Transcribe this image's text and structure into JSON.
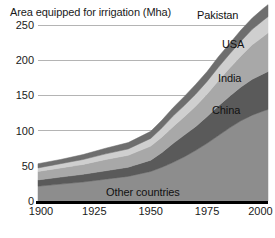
{
  "chart_data": {
    "type": "area",
    "title": "Area equipped for irrigation (Mha)",
    "xlabel": "",
    "ylabel": "Area equipped for irrigation (Mha)",
    "stacked": true,
    "grid": true,
    "legend_position": "inline-right",
    "xlim": [
      1900,
      2002
    ],
    "ylim": [
      0,
      280
    ],
    "xticks": [
      1900,
      1925,
      1950,
      1975,
      2000
    ],
    "yticks": [
      0,
      50,
      100,
      150,
      200,
      250
    ],
    "xtick_labels": [
      "1900",
      "1925",
      "1950",
      "1975",
      "2000"
    ],
    "ytick_labels": [
      "0",
      "50",
      "100",
      "150",
      "200",
      "250"
    ],
    "x": [
      1900,
      1910,
      1920,
      1930,
      1940,
      1950,
      1955,
      1960,
      1965,
      1970,
      1975,
      1980,
      1985,
      1990,
      1995,
      2000,
      2002
    ],
    "series": [
      {
        "name": "Other countries",
        "label": "Other countries",
        "color": "#8d8d8d",
        "values": [
          21,
          24,
          27,
          31,
          35,
          42,
          48,
          55,
          63,
          72,
          82,
          93,
          104,
          114,
          122,
          128,
          130
        ]
      },
      {
        "name": "China",
        "label": "China",
        "color": "#5a5a5a",
        "values": [
          9,
          10,
          11,
          12,
          13,
          16,
          21,
          27,
          31,
          34,
          38,
          42,
          45,
          48,
          51,
          53,
          54
        ]
      },
      {
        "name": "India",
        "label": "India",
        "color": "#a8a8a8",
        "values": [
          12,
          13,
          14,
          16,
          17,
          20,
          22,
          24,
          26,
          29,
          32,
          36,
          40,
          44,
          49,
          53,
          55
        ]
      },
      {
        "name": "USA",
        "label": "USA",
        "color": "#cfcfcf",
        "values": [
          5,
          6,
          7,
          8,
          9,
          11,
          13,
          15,
          16,
          17,
          18,
          19,
          20,
          21,
          22,
          23,
          23
        ]
      },
      {
        "name": "Pakistan",
        "label": "Pakistan",
        "color": "#6e6e6e",
        "values": [
          6,
          6,
          7,
          8,
          9,
          10,
          11,
          12,
          13,
          14,
          14,
          15,
          15,
          16,
          16,
          17,
          17
        ]
      }
    ],
    "totals": [
      53,
      59,
      66,
      75,
      83,
      99,
      115,
      133,
      149,
      166,
      184,
      205,
      224,
      243,
      260,
      274,
      279
    ],
    "series_labels_placement": [
      {
        "name": "Pakistan",
        "x_px": 197,
        "y_px": 9
      },
      {
        "name": "USA",
        "x_px": 222,
        "y_px": 38
      },
      {
        "name": "India",
        "x_px": 218,
        "y_px": 72
      },
      {
        "name": "China",
        "x_px": 212,
        "y_px": 104
      },
      {
        "name": "Other countries",
        "x_px": 106,
        "y_px": 186
      }
    ],
    "colors": {
      "grid": "#b4b4b4",
      "axis": "#000000",
      "text": "#1a1a1a",
      "background": "#ffffff"
    }
  },
  "plot_geometry": {
    "left_px": 38,
    "right_px": 268,
    "top_px": 4,
    "bottom_px": 201
  }
}
